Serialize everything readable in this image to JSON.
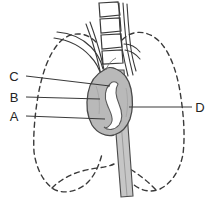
{
  "figure": {
    "background_color": "#ffffff",
    "line_color": "#3a3a3a",
    "mass_fill_color": "#b9b9b9",
    "trachea_fill_color": "#c2c2c2",
    "label_text_color": "#242424",
    "width": 215,
    "height": 212
  },
  "labels": [
    {
      "id": "C",
      "text": "C",
      "x": 14,
      "y": 80,
      "side": "left"
    },
    {
      "id": "B",
      "text": "B",
      "x": 14,
      "y": 101,
      "side": "left"
    },
    {
      "id": "A",
      "text": "A",
      "x": 14,
      "y": 119,
      "side": "left"
    },
    {
      "id": "D",
      "text": "D",
      "x": 196,
      "y": 111,
      "side": "right"
    }
  ],
  "leader_lines": [
    {
      "id": "C",
      "from_x": 26,
      "from_y": 76,
      "to_x": 110,
      "to_y": 86
    },
    {
      "id": "B",
      "from_x": 26,
      "from_y": 97,
      "to_x": 100,
      "to_y": 99
    },
    {
      "id": "A",
      "from_x": 26,
      "from_y": 116,
      "to_x": 105,
      "to_y": 119
    },
    {
      "id": "D",
      "from_x": 192,
      "from_y": 107,
      "to_x": 129,
      "to_y": 107
    }
  ],
  "structures": {
    "vertebrae_count": 4,
    "lung_outline_style": "dashed",
    "mass_label": "mediastinal-mass",
    "trachea_label": "trachea"
  }
}
